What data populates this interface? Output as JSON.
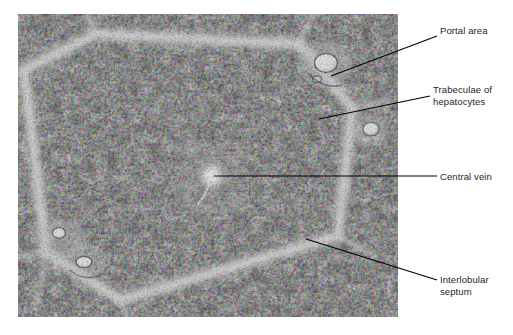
{
  "figure": {
    "kind": "histology-micrograph",
    "image_region": {
      "x": 18,
      "y": 14,
      "width": 380,
      "height": 303
    },
    "background_color": "#ffffff",
    "text_color": "#231f20",
    "leader_color": "#000000"
  },
  "labels": [
    {
      "id": "portal-area",
      "text": "Portal area",
      "x": 440,
      "y": 31,
      "leader": {
        "x1": 331,
        "y1": 76,
        "x2": 437,
        "y2": 36
      }
    },
    {
      "id": "trabeculae-of-hepatocytes",
      "text": "Trabeculae of\nhepatocytes",
      "x": 433,
      "y": 90,
      "leader": {
        "x1": 319,
        "y1": 119,
        "x2": 430,
        "y2": 96
      }
    },
    {
      "id": "central-vein",
      "text": "Central vein",
      "x": 440,
      "y": 171,
      "leader": {
        "x1": 214,
        "y1": 176,
        "x2": 437,
        "y2": 176
      }
    },
    {
      "id": "interlobular-septum",
      "text": "Interlobular\nseptum",
      "x": 440,
      "y": 274,
      "leader": {
        "x1": 306,
        "y1": 239,
        "x2": 437,
        "y2": 280
      }
    }
  ],
  "structures": {
    "central_vein": {
      "cx": 212,
      "cy": 176,
      "r": 6
    },
    "portal_areas": [
      {
        "cx": 326,
        "cy": 65,
        "rx": 10,
        "ry": 8
      },
      {
        "cx": 371,
        "cy": 130,
        "rx": 7,
        "ry": 6
      },
      {
        "cx": 62,
        "cy": 238,
        "rx": 6,
        "ry": 5
      },
      {
        "cx": 84,
        "cy": 262,
        "rx": 7,
        "ry": 5
      }
    ],
    "lobule_outline": "M 24,70 L 95,34 L 300,44 L 352,108 L 338,236 L 120,300 L 46,252 Z"
  }
}
